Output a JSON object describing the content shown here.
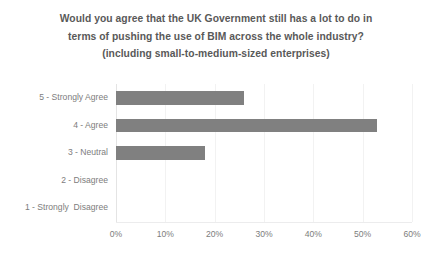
{
  "chart_data": {
    "type": "bar",
    "orientation": "horizontal",
    "title": "Would you agree that the UK Government still has a lot to do in terms of pushing the use of BIM across the whole industry? (including small-to-medium-sized enterprises)",
    "title_lines": [
      "Would you agree that the UK Government still has a lot to do in",
      "terms of pushing the use of BIM across the whole industry?",
      "(including small-to-medium-sized enterprises)"
    ],
    "categories": [
      "5 - Strongly Agree",
      "4 - Agree",
      "3 - Neutral",
      "2 - Disagree",
      "1 - Strongly  Disagree"
    ],
    "values": [
      26,
      53,
      18,
      0,
      0
    ],
    "value_unit": "%",
    "xlabel": "",
    "ylabel": "",
    "xlim": [
      0,
      60
    ],
    "xticks": [
      0,
      10,
      20,
      30,
      40,
      50,
      60
    ],
    "xtick_labels": [
      "0%",
      "10%",
      "20%",
      "30%",
      "40%",
      "50%",
      "60%"
    ],
    "grid": true,
    "grid_axis": "x",
    "legend": false,
    "bar_color": "#808080",
    "title_color": "#595959",
    "tick_color": "#7d7d7d",
    "gridline_color": "#f2f2f2",
    "background": "#ffffff"
  }
}
